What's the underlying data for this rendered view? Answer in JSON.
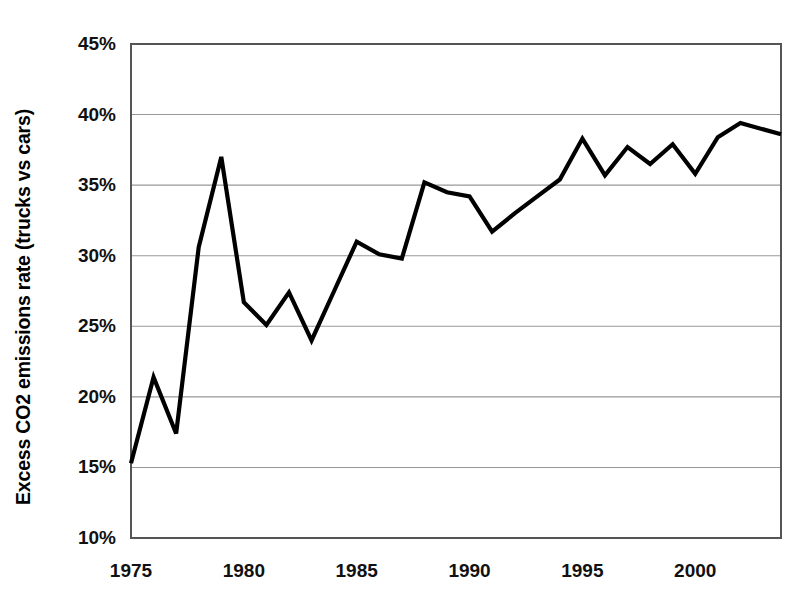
{
  "chart_data": {
    "type": "line",
    "title": "",
    "xlabel": "",
    "ylabel": "Excess CO2 emissions rate (trucks vs cars)",
    "xlim": [
      1975,
      2003.8
    ],
    "ylim": [
      10,
      45
    ],
    "grid": true,
    "legend": "none",
    "y_tick_labels": [
      "45%",
      "40%",
      "35%",
      "30%",
      "25%",
      "20%",
      "15%",
      "10%"
    ],
    "y_ticks": [
      45,
      40,
      35,
      30,
      25,
      20,
      15,
      10
    ],
    "x_tick_labels": [
      "1975",
      "1980",
      "1985",
      "1990",
      "1995",
      "2000"
    ],
    "x_ticks": [
      1975,
      1980,
      1985,
      1990,
      1995,
      2000
    ],
    "line_color": "#000000",
    "grid_color": "#999999",
    "axis_color": "#555555",
    "x": [
      1975,
      1976,
      1977,
      1978,
      1979,
      1980,
      1981,
      1982,
      1983,
      1984,
      1985,
      1986,
      1987,
      1988,
      1989,
      1990,
      1991,
      1992,
      1993,
      1994,
      1995,
      1996,
      1997,
      1998,
      1999,
      2000,
      2001,
      2002
    ],
    "values": [
      15.3,
      21.4,
      17.4,
      30.6,
      37.0,
      26.7,
      25.1,
      27.4,
      24.0,
      27.5,
      31.0,
      30.1,
      29.8,
      35.2,
      34.5,
      34.2,
      31.7,
      33.0,
      34.2,
      35.4,
      38.3,
      35.7,
      37.7,
      36.5,
      37.9,
      35.8,
      38.4,
      39.4
    ],
    "series_name": "Excess CO2 emissions rate (trucks vs cars)",
    "final_value": 38.6
  }
}
